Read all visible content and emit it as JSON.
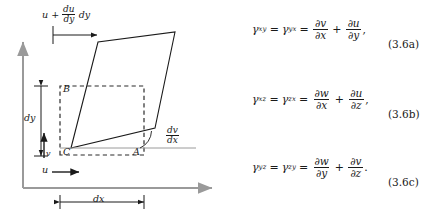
{
  "figure": {
    "diagram": {
      "title_label": "shear-strain-element-diagram",
      "top_expression": {
        "lead": "u",
        "plus": "+",
        "frac_num": "du",
        "frac_den": "dy",
        "trail": "dy"
      },
      "vertex_labels": {
        "a": "A",
        "b": "B",
        "c": "C"
      },
      "dimension_labels": {
        "dy": "dy",
        "dx": "dx"
      },
      "velocity_labels": {
        "u": "u",
        "v": "v"
      },
      "angle_label": {
        "num": "dv",
        "den": "dx"
      },
      "colors": {
        "axis": "#9a9a9a",
        "ink": "#1a1a1a",
        "dashed": "#2b2b2b",
        "background": "#ffffff"
      }
    },
    "equations": [
      {
        "id": "eq-3-6a",
        "lhs_symbol": "γ",
        "lhs_sub": "xy",
        "eq1": "=",
        "mid_symbol": "γ",
        "mid_sub": "yx",
        "eq2": "=",
        "term1_num_op": "∂",
        "term1_num_var": "v",
        "term1_den_op": "∂",
        "term1_den_var": "x",
        "plus": "+",
        "term2_num_op": "∂",
        "term2_num_var": "u",
        "term2_den_op": "∂",
        "term2_den_var": "y",
        "punct": ",",
        "number": "(3.6a)"
      },
      {
        "id": "eq-3-6b",
        "lhs_symbol": "γ",
        "lhs_sub": "xz",
        "eq1": "=",
        "mid_symbol": "γ",
        "mid_sub": "zx",
        "eq2": "=",
        "term1_num_op": "∂",
        "term1_num_var": "w",
        "term1_den_op": "∂",
        "term1_den_var": "x",
        "plus": "+",
        "term2_num_op": "∂",
        "term2_num_var": "u",
        "term2_den_op": "∂",
        "term2_den_var": "z",
        "punct": ",",
        "number": "(3.6b)"
      },
      {
        "id": "eq-3-6c",
        "lhs_symbol": "γ",
        "lhs_sub": "yz",
        "eq1": "=",
        "mid_symbol": "γ",
        "mid_sub": "zy",
        "eq2": "=",
        "term1_num_op": "∂",
        "term1_num_var": "w",
        "term1_den_op": "∂",
        "term1_den_var": "y",
        "plus": "+",
        "term2_num_op": "∂",
        "term2_num_var": "v",
        "term2_den_op": "∂",
        "term2_den_var": "z",
        "punct": ".",
        "number": "(3.6c)"
      }
    ]
  }
}
